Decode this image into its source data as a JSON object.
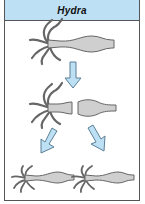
{
  "title": "Hydra",
  "colors": {
    "header_bg": "#bde0f5",
    "arrow_fill": "#bde0f5",
    "arrow_stroke": "#5a7f96",
    "body_fill": "#cfcfcf",
    "outline": "#666666",
    "border": "#555555"
  },
  "stages": [
    {
      "name": "parent-hydra",
      "description": "Whole hydra"
    },
    {
      "name": "fission",
      "description": "Hydra splits into two parts"
    },
    {
      "name": "offspring",
      "description": "Two new hydras regenerate"
    }
  ]
}
